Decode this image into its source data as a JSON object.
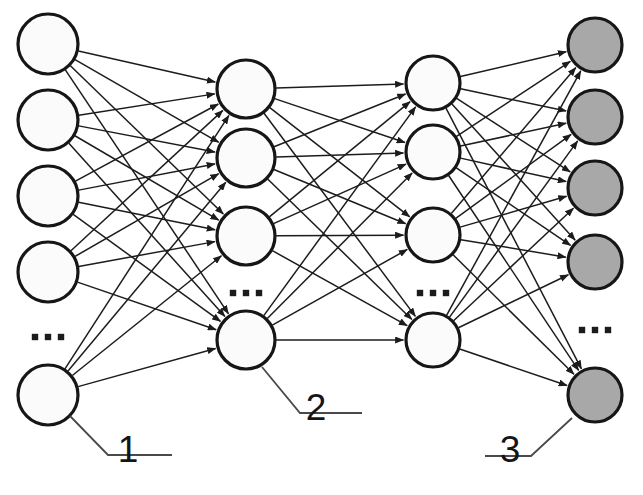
{
  "diagram": {
    "width": 643,
    "height": 495,
    "background_color": "#ffffff",
    "edge_color": "#1c1c1c",
    "node_stroke_color": "#161616",
    "leader_color": "#4a4a4a"
  },
  "layers": [
    {
      "id": "input-layer",
      "name": "input-layer",
      "index": 1,
      "node_fill": "#fbfbfb",
      "node_radius": 30,
      "x": 48,
      "node_count_visible": 5,
      "nodes": [
        {
          "name": "input-node-1",
          "cx": 48,
          "cy": 44
        },
        {
          "name": "input-node-2",
          "cx": 48,
          "cy": 120
        },
        {
          "name": "input-node-3",
          "cx": 48,
          "cy": 196
        },
        {
          "name": "input-node-4",
          "cx": 48,
          "cy": 272
        },
        {
          "name": "input-node-n",
          "cx": 48,
          "cy": 395
        }
      ],
      "ellipsis": {
        "name": "input-layer-ellipsis",
        "cx": 48,
        "cy": 337,
        "text": "..."
      }
    },
    {
      "id": "hidden-layer-1",
      "name": "hidden-layer-1",
      "index": 2,
      "node_fill": "#fbfbfb",
      "node_radius": 29,
      "x": 246,
      "node_count_visible": 4,
      "nodes": [
        {
          "name": "hidden1-node-1",
          "cx": 246,
          "cy": 89
        },
        {
          "name": "hidden1-node-2",
          "cx": 246,
          "cy": 158
        },
        {
          "name": "hidden1-node-3",
          "cx": 246,
          "cy": 236
        },
        {
          "name": "hidden1-node-n",
          "cx": 246,
          "cy": 340
        }
      ],
      "ellipsis": {
        "name": "hidden-layer-1-ellipsis",
        "cx": 246,
        "cy": 293,
        "text": "..."
      }
    },
    {
      "id": "hidden-layer-2",
      "name": "hidden-layer-2",
      "index": 3,
      "node_fill": "#fbfbfb",
      "node_radius": 27,
      "x": 433,
      "node_count_visible": 4,
      "nodes": [
        {
          "name": "hidden2-node-1",
          "cx": 433,
          "cy": 83
        },
        {
          "name": "hidden2-node-2",
          "cx": 433,
          "cy": 152
        },
        {
          "name": "hidden2-node-3",
          "cx": 433,
          "cy": 235
        },
        {
          "name": "hidden2-node-n",
          "cx": 433,
          "cy": 340
        }
      ],
      "ellipsis": {
        "name": "hidden-layer-2-ellipsis",
        "cx": 433,
        "cy": 293,
        "text": "..."
      }
    },
    {
      "id": "output-layer",
      "name": "output-layer",
      "index": 4,
      "node_fill": "#a8a8a8",
      "node_radius": 27,
      "x": 595,
      "node_count_visible": 5,
      "nodes": [
        {
          "name": "output-node-1",
          "cx": 595,
          "cy": 45
        },
        {
          "name": "output-node-2",
          "cx": 595,
          "cy": 117
        },
        {
          "name": "output-node-3",
          "cx": 595,
          "cy": 188
        },
        {
          "name": "output-node-4",
          "cx": 595,
          "cy": 262
        },
        {
          "name": "output-node-n",
          "cx": 595,
          "cy": 395
        }
      ],
      "ellipsis": {
        "name": "output-layer-ellipsis",
        "cx": 595,
        "cy": 330,
        "text": "..."
      }
    }
  ],
  "callouts": [
    {
      "name": "callout-1",
      "label": "1",
      "text_x": 128,
      "text_y": 462,
      "leader": "M 70,416 L 108,455 L 172,455",
      "refers_to": "input-node-n"
    },
    {
      "name": "callout-2",
      "label": "2",
      "text_x": 316,
      "text_y": 420,
      "leader": "M 262,367 L 300,413 L 362,413",
      "refers_to": "hidden1-node-n"
    },
    {
      "name": "callout-3",
      "label": "3",
      "text_x": 510,
      "text_y": 462,
      "leader": "M 572,418 L 531,456 L 485,456",
      "refers_to": "output-node-n"
    }
  ]
}
